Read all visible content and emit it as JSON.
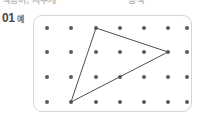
{
  "page": {
    "width": 200,
    "height": 117,
    "background_color": "#ffffff"
  },
  "clipped_header": {
    "visible": true,
    "left_fragment": "색종이, 지우개",
    "right_fragment": "공책"
  },
  "problem_label": {
    "number": "01",
    "tag": "예",
    "color": "#4a4a4a"
  },
  "geoboard": {
    "panel": {
      "x": 33,
      "y": 15,
      "width": 159,
      "height": 97,
      "border_color": "#d6d6d6",
      "fill_color": "#ffffff",
      "corner_radius": 9
    },
    "grid": {
      "columns": 7,
      "rows": 4,
      "dot_color": "#5c5c5c",
      "dot_radius": 2,
      "col_x": [
        13,
        37,
        62,
        86,
        110,
        134,
        153
      ],
      "row_y": [
        12,
        36,
        61,
        86
      ]
    },
    "shape": {
      "name": "triangle",
      "stroke_color": "#4f4f4f",
      "stroke_width": 1,
      "fill": "none",
      "vertices": [
        {
          "label": "top",
          "col": 3,
          "row": 1,
          "x": 62,
          "y": 12
        },
        {
          "label": "right",
          "col": 6,
          "row": 2,
          "x": 134,
          "y": 36
        },
        {
          "label": "bottom-left",
          "col": 2,
          "row": 4,
          "x": 37,
          "y": 86
        }
      ],
      "points_attr": "62,12 134,36 37,86"
    }
  }
}
